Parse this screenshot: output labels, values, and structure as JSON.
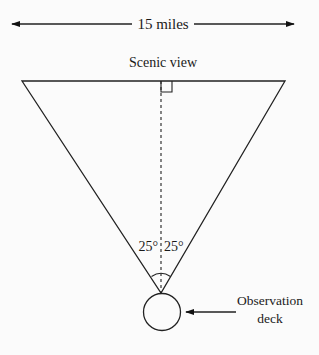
{
  "diagram": {
    "width_label": "15 miles",
    "top_label": "Scenic view",
    "angle_left": "25°",
    "angle_right": "25°",
    "deck_label_line1": "Observation",
    "deck_label_line2": "deck"
  },
  "colors": {
    "stroke": "#222222",
    "background": "#fbfbfb"
  }
}
